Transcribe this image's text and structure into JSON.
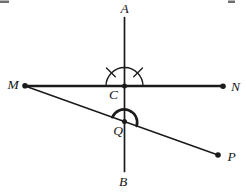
{
  "canvas": {
    "width": 246,
    "height": 193,
    "background": "#ffffff",
    "ink": "#1b1b1b"
  },
  "figure": {
    "kind": "geometry-diagram",
    "labels": [
      {
        "name": "A",
        "text": "A",
        "x": 124.5,
        "y": 13
      },
      {
        "name": "B",
        "text": "B",
        "x": 123,
        "y": 185.5
      },
      {
        "name": "M",
        "text": "M",
        "x": 13,
        "y": 88.5
      },
      {
        "name": "N",
        "text": "N",
        "x": 235.5,
        "y": 91
      },
      {
        "name": "C",
        "text": "C",
        "x": 113.5,
        "y": 98.5
      },
      {
        "name": "Q",
        "text": "Q",
        "x": 118,
        "y": 134.5
      },
      {
        "name": "P",
        "text": "P",
        "x": 231.5,
        "y": 160.5
      }
    ],
    "segments": [
      {
        "name": "line-AB",
        "x1": 124.5,
        "y1": 17.5,
        "x2": 124.5,
        "y2": 171.5,
        "width": 1.7
      },
      {
        "name": "line-MN",
        "x1": 25,
        "y1": 86,
        "x2": 223,
        "y2": 86,
        "width": 2.3
      },
      {
        "name": "line-MP",
        "x1": 25,
        "y1": 86,
        "x2": 218,
        "y2": 155,
        "width": 1.5
      }
    ],
    "points": [
      {
        "name": "point-M",
        "x": 25,
        "y": 85.8,
        "r": 2.8
      },
      {
        "name": "point-N",
        "x": 223,
        "y": 86.2,
        "r": 2.8
      },
      {
        "name": "point-P",
        "x": 218,
        "y": 155,
        "r": 2.8
      },
      {
        "name": "point-C",
        "x": 124.5,
        "y": 86,
        "r": 2.5
      },
      {
        "name": "point-Q",
        "x": 124.5,
        "y": 121.6,
        "r": 2.5
      }
    ],
    "arcs": [
      {
        "name": "angle-arc-C",
        "path": "M 106 86 A 18.5 18.5 0 0 1 143 86",
        "width": 1.4
      },
      {
        "name": "angle-arc-Q",
        "path": "M 112.3 117.2 A 13 13 0 0 1 136.7 126",
        "width": 2.6
      }
    ],
    "tick_marks": [
      {
        "name": "equal-angle-tick-left",
        "x1": 115.3,
        "y1": 76.8,
        "x2": 106.5,
        "y2": 68,
        "width": 1.3
      },
      {
        "name": "equal-angle-tick-right",
        "x1": 133.7,
        "y1": 76.8,
        "x2": 142.5,
        "y2": 68,
        "width": 1.3
      }
    ],
    "artifacts": [
      {
        "name": "page-edge-artifact-left",
        "x": 0,
        "y": 0.5,
        "w": 9,
        "h": 2.5,
        "color": "#6f6f6f"
      },
      {
        "name": "page-edge-artifact-right",
        "x": 228,
        "y": 0.5,
        "w": 7,
        "h": 2.5,
        "color": "#6f6f6f"
      }
    ]
  }
}
